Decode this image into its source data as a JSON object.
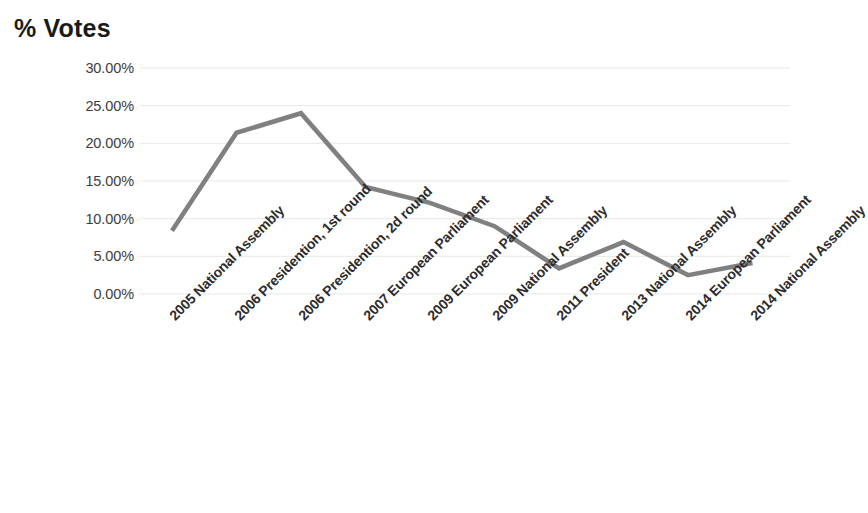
{
  "chart_data": {
    "type": "line",
    "title": "% Votes",
    "xlabel": "",
    "ylabel": "",
    "ylim": [
      0,
      30
    ],
    "ytick_labels": [
      "30.00%",
      "25.00%",
      "20.00%",
      "15.00%",
      "10.00%",
      "5.00%",
      "0.00%"
    ],
    "ytick_values": [
      30,
      25,
      20,
      15,
      10,
      5,
      0
    ],
    "grid": true,
    "legend": "none",
    "line_color": "#808080",
    "grid_color": "#e8e8e8",
    "categories": [
      "2005 National Assembly",
      "2006 Presidention, 1st round",
      "2006 Presidention, 2d round",
      "2007 European Parliament",
      "2009 European Parliament",
      "2009 National Assembly",
      "2011 President",
      "2013 National Assembly",
      "2014 European Parliament",
      "2014 National Assembly"
    ],
    "values": [
      8.4,
      21.4,
      24.0,
      14.2,
      12.1,
      9.0,
      3.4,
      6.9,
      2.5,
      4.1
    ]
  }
}
